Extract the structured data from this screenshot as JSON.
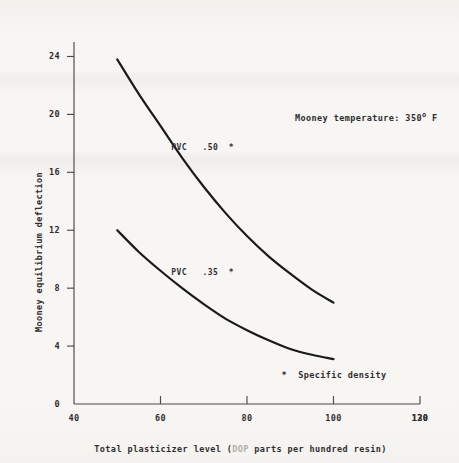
{
  "figure": {
    "background_color": "#f7f6f3",
    "ink_color": "#1a1a1a"
  },
  "chart_data": {
    "type": "line",
    "title": "",
    "subtitle": "",
    "xlabel_prefix": "Total plasticizer level (",
    "xlabel_faded": "DOP",
    "xlabel_suffix": " parts per hundred resin)",
    "xlabel": "Total plasticizer level (DOP parts per hundred resin)",
    "ylabel": "Mooney equilibrium deflection",
    "xlim": [
      40,
      120
    ],
    "ylim": [
      0,
      25
    ],
    "xticks": [
      40,
      60,
      80,
      100,
      120
    ],
    "xtick_labels": [
      "40",
      "60",
      "80",
      "100",
      "120"
    ],
    "xtick_overstrike_last": "130",
    "yticks": [
      0,
      4,
      8,
      12,
      16,
      20,
      24
    ],
    "ytick_labels": [
      "0",
      "4",
      "8",
      "12",
      "16",
      "20",
      "24"
    ],
    "grid": false,
    "legend_position": "inline-curve-labels",
    "series": [
      {
        "name": "PVC .50 *",
        "label_text": "PVC   .50  *",
        "points": [
          [
            50,
            23.8
          ],
          [
            55,
            21.4
          ],
          [
            60,
            19.2
          ],
          [
            65,
            17.0
          ],
          [
            70,
            15.0
          ],
          [
            75,
            13.2
          ],
          [
            80,
            11.6
          ],
          [
            85,
            10.2
          ],
          [
            90,
            9.0
          ],
          [
            95,
            7.9
          ],
          [
            100,
            7.0
          ]
        ]
      },
      {
        "name": "PVC .35 *",
        "label_text": "PVC   .35  *",
        "points": [
          [
            50,
            12.0
          ],
          [
            55,
            10.5
          ],
          [
            60,
            9.2
          ],
          [
            65,
            8.0
          ],
          [
            70,
            6.9
          ],
          [
            75,
            5.9
          ],
          [
            80,
            5.1
          ],
          [
            85,
            4.4
          ],
          [
            90,
            3.8
          ],
          [
            95,
            3.4
          ],
          [
            100,
            3.1
          ]
        ]
      }
    ],
    "annotations": [
      {
        "id": "mooney-temperature",
        "text_prefix": "Mooney temperature: 350",
        "text_degree": "o",
        "text_suffix": " F",
        "text": "Mooney temperature: 350° F",
        "x": 86,
        "y": 20.4
      },
      {
        "id": "specific-density-footnote",
        "text": "*  Specific density",
        "x": 88,
        "y": 1.9
      }
    ]
  }
}
